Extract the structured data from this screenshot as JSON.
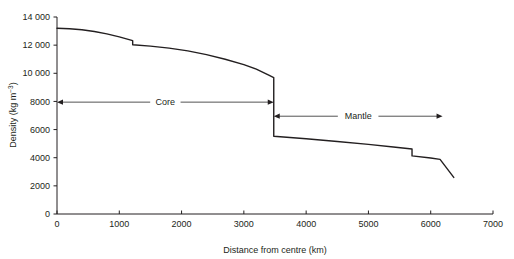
{
  "chart_data": {
    "type": "line",
    "title": "",
    "subtitle": "",
    "xlabel": "Distance from centre (km)",
    "ylabel": "Density (kg m−3)",
    "ylabel_base": "Density (kg m",
    "ylabel_exponent": "−3",
    "ylabel_close": ")",
    "xlim": [
      0,
      7000
    ],
    "ylim": [
      0,
      14000
    ],
    "grid": false,
    "legend": "none",
    "x_ticks": [
      0,
      1000,
      2000,
      3000,
      4000,
      5000,
      6000,
      7000
    ],
    "x_tick_labels": [
      "0",
      "1000",
      "2000",
      "3000",
      "4000",
      "5000",
      "6000",
      "7000"
    ],
    "y_ticks": [
      0,
      2000,
      4000,
      6000,
      8000,
      10000,
      12000,
      14000
    ],
    "y_tick_labels": [
      "0",
      "2000",
      "4000",
      "6000",
      "8000",
      "10 000",
      "12 000",
      "14 000"
    ],
    "series": [
      {
        "name": "Earth density profile",
        "color": "#231f20",
        "points": [
          {
            "x": 0,
            "y": 13200
          },
          {
            "x": 200,
            "y": 13170
          },
          {
            "x": 400,
            "y": 13090
          },
          {
            "x": 600,
            "y": 12970
          },
          {
            "x": 800,
            "y": 12800
          },
          {
            "x": 1000,
            "y": 12590
          },
          {
            "x": 1215,
            "y": 12320
          },
          {
            "x": 1215,
            "y": 12030
          },
          {
            "x": 1500,
            "y": 11930
          },
          {
            "x": 1800,
            "y": 11790
          },
          {
            "x": 2100,
            "y": 11590
          },
          {
            "x": 2400,
            "y": 11330
          },
          {
            "x": 2700,
            "y": 11000
          },
          {
            "x": 3000,
            "y": 10620
          },
          {
            "x": 3200,
            "y": 10300
          },
          {
            "x": 3400,
            "y": 9870
          },
          {
            "x": 3480,
            "y": 9700
          },
          {
            "x": 3480,
            "y": 5530
          },
          {
            "x": 4000,
            "y": 5350
          },
          {
            "x": 4500,
            "y": 5150
          },
          {
            "x": 5000,
            "y": 4950
          },
          {
            "x": 5400,
            "y": 4760
          },
          {
            "x": 5700,
            "y": 4620
          },
          {
            "x": 5700,
            "y": 4130
          },
          {
            "x": 6000,
            "y": 3980
          },
          {
            "x": 6150,
            "y": 3880
          },
          {
            "x": 6370,
            "y": 2600
          }
        ]
      }
    ],
    "annotations": [
      {
        "name": "core-span-arrow",
        "label": "Core",
        "x_start": 0,
        "x_end": 3480,
        "y": 7950,
        "arrows": "both"
      },
      {
        "name": "mantle-span-arrow",
        "label": "Mantle",
        "x_start": 3480,
        "x_end": 6190,
        "y": 6950,
        "arrows": "both"
      }
    ]
  }
}
